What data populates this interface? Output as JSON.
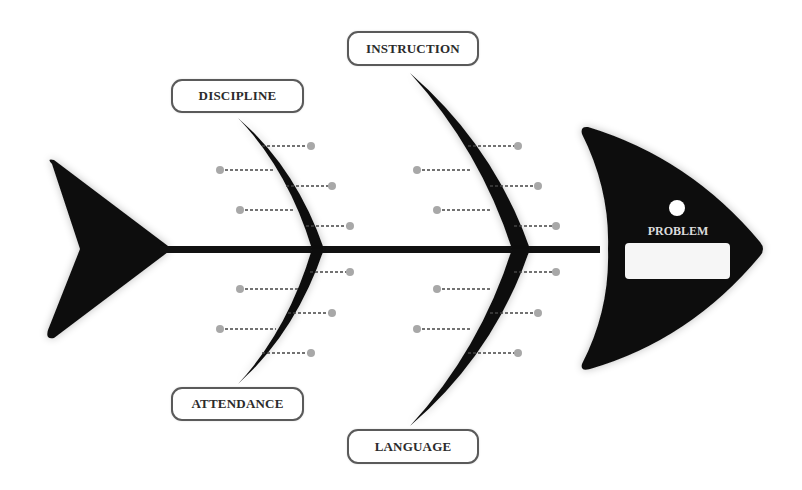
{
  "diagram": {
    "type": "fishbone",
    "problem": {
      "label": "PROBLEM",
      "value": ""
    },
    "categories": [
      {
        "id": "discipline",
        "label": "DISCIPLINE",
        "position": "top",
        "cause_count": 5
      },
      {
        "id": "instruction",
        "label": "INSTRUCTION",
        "position": "top",
        "cause_count": 5
      },
      {
        "id": "attendance",
        "label": "ATTENDANCE",
        "position": "bottom",
        "cause_count": 5
      },
      {
        "id": "language",
        "label": "LANGUAGE",
        "position": "bottom",
        "cause_count": 5
      }
    ]
  },
  "colors": {
    "fish": "#111111",
    "box_border": "#5a5a5a",
    "cause_dot": "#a8a8a8",
    "cause_line": "#444444",
    "problem_text": "#dcdcdc",
    "problem_box": "#f6f6f6"
  }
}
